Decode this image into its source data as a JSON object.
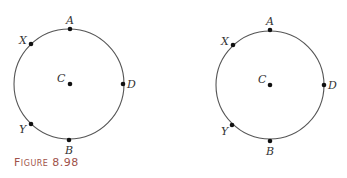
{
  "caption": "Figure 8.98",
  "figures": [
    {
      "id": "left",
      "center": {
        "x": 69,
        "y": 84,
        "label": "C"
      },
      "radius": 55,
      "stroke": "#555555",
      "points": [
        {
          "label": "A",
          "x": 69,
          "y": 29
        },
        {
          "label": "X",
          "x": 31,
          "y": 44
        },
        {
          "label": "D",
          "x": 124,
          "y": 84
        },
        {
          "label": "Y",
          "x": 31,
          "y": 124
        },
        {
          "label": "B",
          "x": 69,
          "y": 140
        }
      ]
    },
    {
      "id": "right",
      "center": {
        "x": 270,
        "y": 85,
        "label": "C"
      },
      "radius": 54,
      "stroke": "#555555",
      "points": [
        {
          "label": "A",
          "x": 270,
          "y": 30
        },
        {
          "label": "X",
          "x": 233,
          "y": 45
        },
        {
          "label": "D",
          "x": 324,
          "y": 85
        },
        {
          "label": "Y",
          "x": 232,
          "y": 125
        },
        {
          "label": "B",
          "x": 270,
          "y": 141
        }
      ]
    }
  ]
}
